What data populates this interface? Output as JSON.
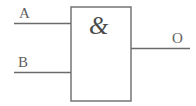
{
  "diagram": {
    "type": "logic-gate-schematic",
    "gate": {
      "symbol": "&",
      "function": "AND",
      "body": {
        "x": 71,
        "y": 7,
        "width": 60,
        "height": 94
      },
      "stroke_color": "#6b6b6b",
      "fill_color": "#ffffff",
      "stroke_width": 1.4
    },
    "inputs": [
      {
        "label": "A",
        "line": {
          "x1": 14,
          "y1": 23.5,
          "x2": 71,
          "y2": 23.5
        },
        "label_position": {
          "x": 19,
          "y": 6
        }
      },
      {
        "label": "B",
        "line": {
          "x1": 14,
          "y1": 72.5,
          "x2": 71,
          "y2": 72.5
        },
        "label_position": {
          "x": 18,
          "y": 55
        }
      }
    ],
    "outputs": [
      {
        "label": "O",
        "line": {
          "x1": 131,
          "y1": 48.5,
          "x2": 190,
          "y2": 48.5
        },
        "label_position": {
          "x": 172,
          "y": 31
        }
      }
    ],
    "background_color": "#ffffff",
    "line_color": "#6b6b6b",
    "text_color": "#5f5f5f"
  }
}
